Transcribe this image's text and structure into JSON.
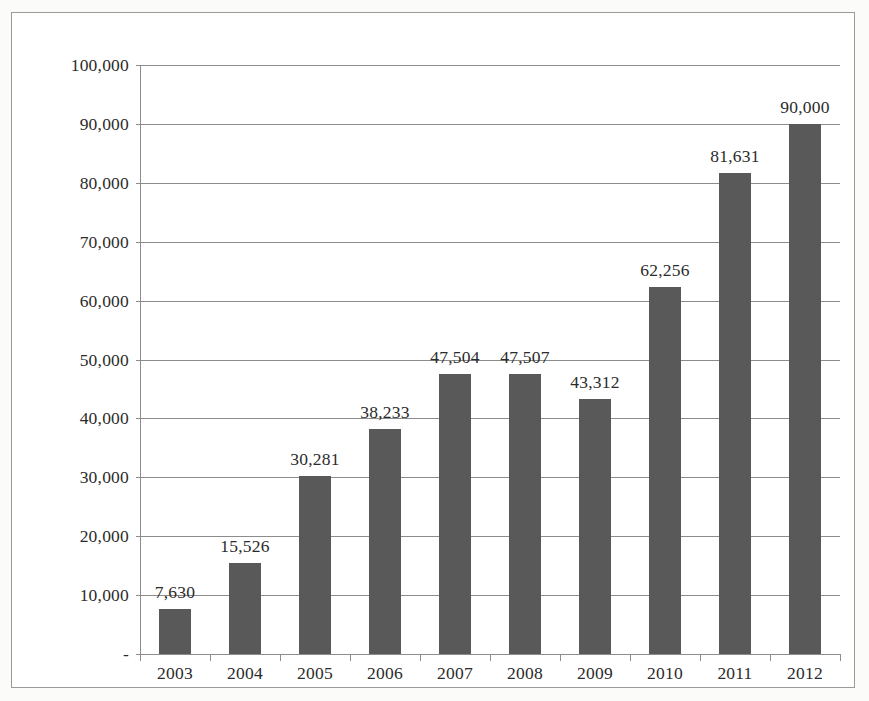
{
  "chart_data": {
    "type": "bar",
    "title": "",
    "subtitle": "",
    "xlabel": "",
    "ylabel": "",
    "categories": [
      "2003",
      "2004",
      "2005",
      "2006",
      "2007",
      "2008",
      "2009",
      "2010",
      "2011",
      "2012"
    ],
    "values": [
      7630,
      15526,
      30281,
      38233,
      47504,
      47507,
      43312,
      62256,
      81631,
      90000
    ],
    "data_labels": [
      "7,630",
      "15,526",
      "30,281",
      "38,233",
      "47,504",
      "47,507",
      "43,312",
      "62,256",
      "81,631",
      "90,000"
    ],
    "series": [
      {
        "name": "",
        "values": [
          7630,
          15526,
          30281,
          38233,
          47504,
          47507,
          43312,
          62256,
          81631,
          90000
        ]
      }
    ],
    "ylim": [
      0,
      100000
    ],
    "ytick_values": [
      0,
      10000,
      20000,
      30000,
      40000,
      50000,
      60000,
      70000,
      80000,
      90000,
      100000
    ],
    "ytick_labels": [
      "-",
      "10,000",
      "20,000",
      "30,000",
      "40,000",
      "50,000",
      "60,000",
      "70,000",
      "80,000",
      "90,000",
      "100,000"
    ],
    "grid": true,
    "grid_axis": "y",
    "legend": false,
    "legend_position": "none",
    "bar_color": "#595959",
    "grid_color": "#8c8c8c",
    "axis_color": "#8c8c8c",
    "text_color": "#2b2b2b",
    "plot_background": "#ffffff",
    "frame_border_color": "#9a9a9a",
    "data_labels_position": "outside-end",
    "annotations": []
  }
}
